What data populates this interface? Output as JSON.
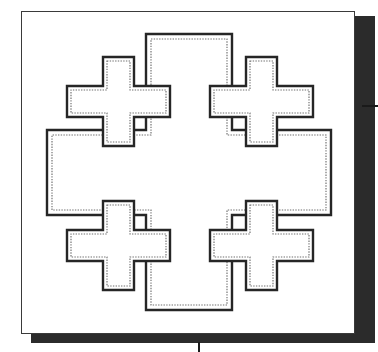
{
  "figure": {
    "alt_title": "Crusader's Cross",
    "caption": "",
    "medium": "line drawing / engraving plate"
  },
  "plate": {
    "background_color": "#ffffff",
    "border_color": "#3a3a3a",
    "shadow_color": "#2b2b2b",
    "outline_color": "#262626",
    "inner_dotted_color": "#6e6e6e",
    "x": 21,
    "y": 11,
    "width": 334,
    "height": 323
  },
  "marks": {
    "right_tick_label": "right-edge registration tick",
    "bottom_tick_label": "bottom-edge registration tick"
  },
  "shapes": {
    "big_cross": {
      "name": "central-potent-cross",
      "center_x": 189,
      "center_y": 172,
      "arm_half_width": 44,
      "arm_length": 138,
      "outline": "M 146,34 L 232,34 L 232,130 L 331,130 L 331,215 L 232,215 L 232,310 L 146,310 L 146,215 L 47,215 L 47,130 L 146,130 Z",
      "inner": "M 151,39 L 227,39 L 227,135 L 326,135 L 326,210 L 227,210 L 227,305 L 151,305 L 151,210 L 52,210 L 52,135 L 151,135 Z"
    },
    "small_crosses": [
      {
        "name": "quadrant-cross-top-left",
        "center_x": 118,
        "center_y": 101,
        "outline": "M 103,57 L 134,57 L 134,86 L 170,86 L 170,117 L 134,117 L 134,146 L 103,146 L 103,117 L 67,117 L 67,86 L 103,86 Z",
        "inner": "M 107,61 L 130,61 L 130,90 L 166,90 L 166,113 L 130,113 L 130,142 L 107,142 L 107,113 L 71,113 L 71,90 L 107,90 Z"
      },
      {
        "name": "quadrant-cross-top-right",
        "center_x": 261,
        "center_y": 101,
        "outline": "M 246,57 L 277,57 L 277,86 L 313,86 L 313,117 L 277,117 L 277,146 L 246,146 L 246,117 L 210,117 L 210,86 L 246,86 Z",
        "inner": "M 250,61 L 273,61 L 273,90 L 309,90 L 309,113 L 273,113 L 273,142 L 250,142 L 250,113 L 214,113 L 214,90 L 250,90 Z"
      },
      {
        "name": "quadrant-cross-bottom-left",
        "center_x": 118,
        "center_y": 245,
        "outline": "M 103,201 L 134,201 L 134,230 L 170,230 L 170,261 L 134,261 L 134,290 L 103,290 L 103,261 L 67,261 L 67,230 L 103,230 Z",
        "inner": "M 107,205 L 130,205 L 130,234 L 166,234 L 166,257 L 130,257 L 130,286 L 107,286 L 107,257 L 71,257 L 71,234 L 107,234 Z"
      },
      {
        "name": "quadrant-cross-bottom-right",
        "center_x": 261,
        "center_y": 245,
        "outline": "M 246,201 L 277,201 L 277,230 L 313,230 L 313,261 L 277,261 L 277,290 L 246,290 L 246,261 L 210,261 L 210,230 L 246,230 Z",
        "inner": "M 250,205 L 273,205 L 273,234 L 309,234 L 309,257 L 273,257 L 273,286 L 250,286 L 250,257 L 214,257 L 214,234 L 250,234 Z"
      }
    ]
  }
}
